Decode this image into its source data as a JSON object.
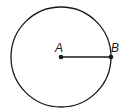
{
  "diagram": {
    "type": "circle-radius",
    "circle": {
      "cx": 61,
      "cy": 57,
      "r": 50,
      "stroke": "#1a1a1a"
    },
    "points": [
      {
        "label": "A",
        "x": 61,
        "y": 57,
        "role": "center"
      },
      {
        "label": "B",
        "x": 111,
        "y": 57,
        "role": "point-on-circle"
      }
    ],
    "segments": [
      {
        "from": "A",
        "to": "B",
        "meaning": "radius"
      }
    ]
  },
  "labels": {
    "center": "A",
    "edge": "B"
  }
}
